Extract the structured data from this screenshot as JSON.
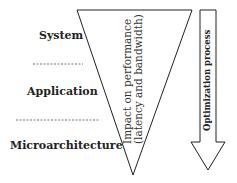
{
  "diagram": {
    "levels": [
      {
        "label": "System"
      },
      {
        "label": "Application"
      },
      {
        "label": "Microarchitecture"
      }
    ],
    "triangle_label_line1": "Impact on performance",
    "triangle_label_line2": "(latency and bandwidth)",
    "arrow_label": "Optimization process"
  }
}
